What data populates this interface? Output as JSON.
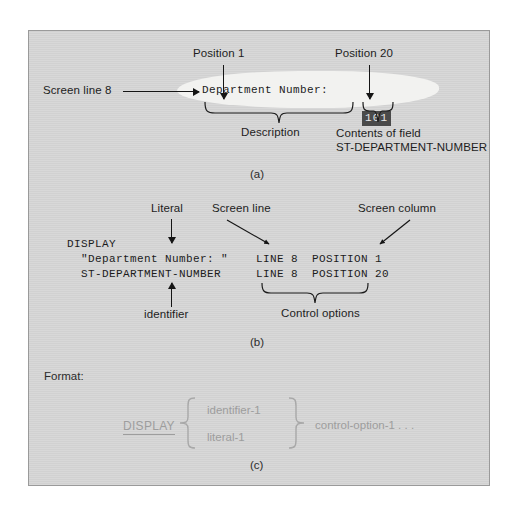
{
  "figure": {
    "panel_a": {
      "callout_position_1": "Position 1",
      "callout_position_20": "Position 20",
      "callout_screen_line": "Screen line 8",
      "screen_text": "Department Number:",
      "field_value": "101",
      "brace_label_description": "Description",
      "brace_label_contents_line1": "Contents of field",
      "brace_label_contents_line2": "ST-DEPARTMENT-NUMBER",
      "caption": "(a)"
    },
    "panel_b": {
      "callout_literal": "Literal",
      "callout_identifier": "identifier",
      "callout_screen_line": "Screen line",
      "callout_screen_column": "Screen column",
      "code_line_1": "DISPLAY",
      "code_line_2": "  \"Department Number: \"",
      "code_line_3": "  ST-DEPARTMENT-NUMBER",
      "options_line_1": "LINE 8  POSITION 1",
      "options_line_2": "LINE 8  POSITION 20",
      "brace_label_control_options": "Control options",
      "caption": "(b)"
    },
    "panel_c": {
      "heading": "Format:",
      "verb": "DISPLAY",
      "operand_1": "identifier-1",
      "operand_2": "literal-1",
      "trailing": "control-option-1 . . .",
      "caption": "(c)"
    }
  },
  "colors": {
    "panel_background": "#d6d6d6",
    "panel_border": "#9a9a9a",
    "screen_highlight": "#f2f2f0",
    "reverse_video_bg": "#4a4a4a",
    "reverse_video_fg": "#e9e9e9",
    "ink": "#1d1d1d",
    "faint_ink": "#9d9d9d"
  }
}
